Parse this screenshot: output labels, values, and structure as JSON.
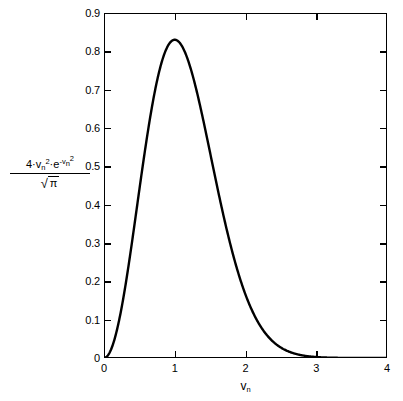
{
  "figure": {
    "background_color": "#ffffff",
    "line_color": "#000000",
    "axis_color": "#000000"
  },
  "axes": {
    "x": {
      "title_base": "v",
      "title_sub": "n",
      "tick_labels": [
        "0",
        "1",
        "2",
        "3",
        "4"
      ],
      "tick_values": [
        0,
        1,
        2,
        3,
        4
      ],
      "min": 0,
      "max": 4
    },
    "y": {
      "title_numerator": {
        "coefficient": "4·",
        "v_base": "v",
        "v_sub": "n",
        "v_exp": "2",
        "dot": "·",
        "e_base": "e",
        "e_exp_minus": "-",
        "e_exp_v": "v",
        "e_exp_sub": "n",
        "e_exp_pow": "2"
      },
      "title_denominator": {
        "radical": "√",
        "radicand": "π"
      },
      "tick_labels": [
        "0.9",
        "0.8",
        "0.7",
        "0.6",
        "0.5",
        "0.4",
        "0.3",
        "0.2",
        "0.1",
        "0"
      ],
      "tick_values": [
        0.9,
        0.8,
        0.7,
        0.6,
        0.5,
        0.4,
        0.3,
        0.2,
        0.1,
        0
      ],
      "min": 0,
      "max": 0.9
    }
  },
  "chart_data": {
    "type": "line",
    "title": "",
    "subtitle": "",
    "xlabel": "v_n",
    "ylabel": "4·v_n^2·e^(-v_n^2) / √π",
    "xlim": [
      0,
      4
    ],
    "ylim": [
      0,
      0.9
    ],
    "grid": false,
    "legend": null,
    "xticks": [
      0,
      1,
      2,
      3,
      4
    ],
    "yticks": [
      0,
      0.1,
      0.2,
      0.3,
      0.4,
      0.5,
      0.6,
      0.7,
      0.8,
      0.9
    ],
    "annotations": [],
    "series": [
      {
        "name": "Maxwell-Boltzmann normalized speed distribution",
        "formula": "f(v_n) = 4*v_n^2*exp(-v_n^2)/sqrt(pi)",
        "peak": {
          "x": 1.0,
          "y": 0.8302
        },
        "x": [
          0.0,
          0.1,
          0.2,
          0.3,
          0.4,
          0.5,
          0.6,
          0.7,
          0.8,
          0.9,
          1.0,
          1.1,
          1.2,
          1.3,
          1.4,
          1.5,
          1.6,
          1.7,
          1.8,
          1.9,
          2.0,
          2.1,
          2.2,
          2.3,
          2.4,
          2.5,
          2.6,
          2.7,
          2.8,
          2.9,
          3.0,
          3.1,
          3.2,
          3.3,
          3.4,
          3.5,
          3.6,
          3.7,
          3.8,
          3.9,
          4.0
        ],
        "y": [
          0.0,
          0.0223,
          0.0868,
          0.1864,
          0.3097,
          0.4394,
          0.5571,
          0.6481,
          0.7045,
          0.7251,
          0.7141,
          0.6786,
          0.6265,
          0.5653,
          0.501,
          0.4382,
          0.3798,
          0.3272,
          0.2812,
          0.2415,
          0.2076,
          0.179,
          0.1548,
          0.1344,
          0.1172,
          0.1026,
          0.0901,
          0.0795,
          0.0703,
          0.0624,
          0.0555,
          0.0495,
          0.0442,
          0.0395,
          0.0354,
          0.0317,
          0.0284,
          0.0255,
          0.0229,
          0.0205,
          0.0184
        ],
        "y_scaled_note": "values plotted are 4*x^2*exp(-x^2)/sqrt(pi)"
      }
    ]
  }
}
